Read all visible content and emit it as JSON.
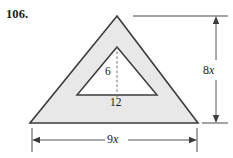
{
  "figure": {
    "problem_number": "106.",
    "background_color": "#ffffff",
    "shaded_fill_color": "#e8e8e8",
    "outline_color": "#3c3c3c",
    "dimension_line_color": "#555555",
    "inner_cutout_fill": "#ffffff",
    "outer_triangle": {
      "name": "outer-triangle",
      "apex": [
        117,
        16
      ],
      "bottom_left": [
        30,
        123
      ],
      "bottom_right": [
        198,
        123
      ],
      "height_label": "8x",
      "base_label": "9x"
    },
    "inner_triangle": {
      "name": "inner-triangle",
      "apex": [
        117,
        47
      ],
      "bottom_left": [
        77,
        95
      ],
      "bottom_right": [
        157,
        95
      ],
      "height_label": "6",
      "base_label": "12"
    },
    "labels": {
      "height_number": "8",
      "height_variable": "x",
      "width_number": "9",
      "width_variable": "x",
      "inner_height": "6",
      "inner_base": "12"
    },
    "dimensions": {
      "vertical": {
        "name": "height-dimension-8x",
        "label": "8x",
        "axis_x": 216,
        "top_y": 16,
        "bottom_y": 123,
        "arrow_style": "double-headed"
      },
      "horizontal": {
        "name": "width-dimension-9x",
        "label": "9x",
        "axis_y": 140,
        "left_x": 32,
        "right_x": 197,
        "arrow_style": "double-headed"
      }
    },
    "inner_height_line": {
      "name": "inner-height-dashed-line",
      "x": 117,
      "top_y": 47,
      "bottom_y": 95,
      "style": "dashed"
    }
  }
}
